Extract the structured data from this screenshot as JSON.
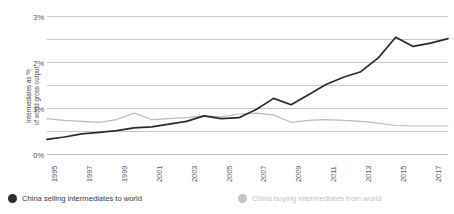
{
  "chart_data": {
    "type": "line",
    "title": "",
    "xlabel": "",
    "ylabel": "Intermediates as % of world gross output",
    "ylabel_line1": "Intermediates as %",
    "ylabel_line2": "of world gross output",
    "ylim": [
      0,
      3
    ],
    "ytick_labels": [
      "0%",
      "1%",
      "2%",
      "3%"
    ],
    "ytick_values": [
      0,
      1,
      2,
      3
    ],
    "gridline_values": [
      0,
      0.5,
      1,
      1.5,
      2,
      2.5,
      3
    ],
    "grid": true,
    "legend_position": "bottom-left",
    "x": [
      1995,
      1996,
      1997,
      1998,
      1999,
      2000,
      2001,
      2002,
      2003,
      2004,
      2005,
      2006,
      2007,
      2008,
      2009,
      2010,
      2011,
      2012,
      2013,
      2014,
      2015,
      2016,
      2017,
      2018
    ],
    "xtick_labels": [
      "1995",
      "1997",
      "1999",
      "2001",
      "2003",
      "2005",
      "2007",
      "2009",
      "2011",
      "2013",
      "2015",
      "2017"
    ],
    "xtick_values": [
      1995,
      1997,
      1999,
      2001,
      2003,
      2005,
      2007,
      2009,
      2011,
      2013,
      2015,
      2017
    ],
    "series": [
      {
        "name": "China selling intermediates to world",
        "color": "#2b2b2b",
        "values": [
          0.33,
          0.38,
          0.45,
          0.48,
          0.52,
          0.58,
          0.6,
          0.66,
          0.72,
          0.84,
          0.78,
          0.8,
          0.98,
          1.22,
          1.08,
          1.3,
          1.52,
          1.68,
          1.8,
          2.1,
          2.55,
          2.35,
          2.42,
          2.52
        ]
      },
      {
        "name": "China buying intermediates from world",
        "color": "#b9bcbd",
        "values": [
          0.78,
          0.74,
          0.72,
          0.7,
          0.76,
          0.9,
          0.76,
          0.78,
          0.8,
          0.84,
          0.82,
          0.88,
          0.9,
          0.86,
          0.7,
          0.74,
          0.76,
          0.74,
          0.72,
          0.68,
          0.63,
          0.62,
          0.62,
          0.62
        ]
      }
    ]
  },
  "legend": {
    "items": [
      {
        "label": "China selling intermediates to world",
        "color": "#2b2b2b",
        "text_color": "#3a3a3a"
      },
      {
        "label": "China buying intermediates from world",
        "color": "#c3c6c7",
        "text_color": "#c0c3c4"
      }
    ]
  },
  "colors": {
    "grid": "#bfc3c5",
    "axis_text": "#55595c",
    "background": "#ffffff"
  }
}
